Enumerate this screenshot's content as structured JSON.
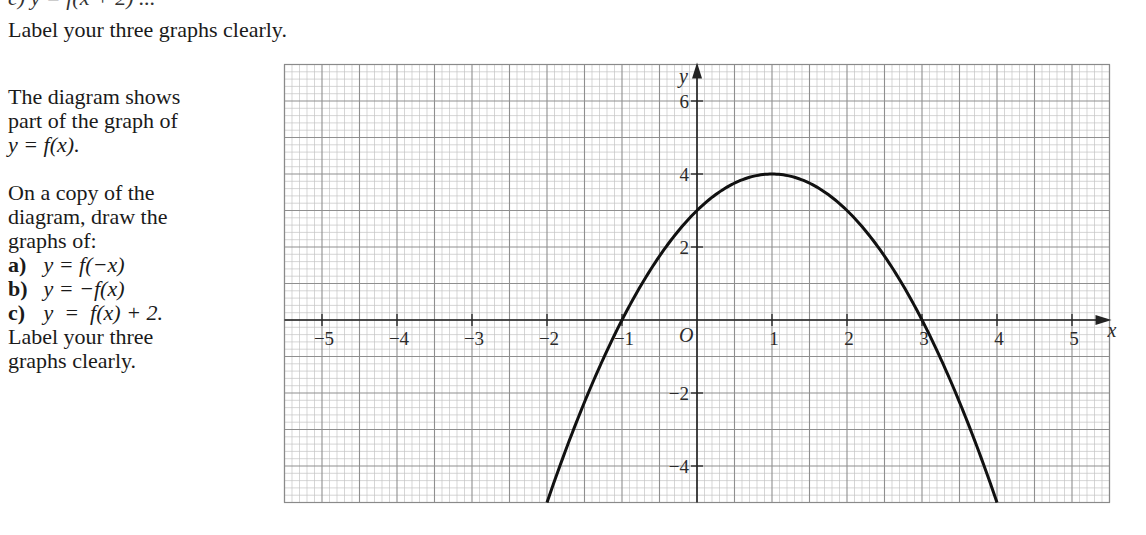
{
  "header": {
    "cut_off_line": "c) y = f(x + 2) ...",
    "instruction": "Label your three graphs clearly."
  },
  "question": {
    "intro_lines": [
      "The diagram shows",
      "part of the graph of",
      "y = f(x)."
    ],
    "task_lines": [
      "On a copy of the",
      "diagram, draw the",
      "graphs of:"
    ],
    "parts": [
      {
        "label": "a)",
        "expr": "y = f(−x)"
      },
      {
        "label": "b)",
        "expr": "y = −f(x)"
      },
      {
        "label": "c)",
        "expr": "y  =  f(x) + 2."
      }
    ],
    "closing_lines": [
      "Label your three",
      "graphs clearly."
    ]
  },
  "chart_data": {
    "type": "line",
    "title": "",
    "xlabel": "x",
    "ylabel": "y",
    "origin_label": "O",
    "xlim": [
      -5.5,
      5.5
    ],
    "ylim": [
      -5,
      7
    ],
    "grid": true,
    "grid_minor_per_major": 5,
    "x_ticks": [
      -5,
      -4,
      -3,
      -2,
      -1,
      1,
      2,
      3,
      4,
      5
    ],
    "x_tick_labels": [
      "−5",
      "−4",
      "−3",
      "−2",
      "−1",
      "1",
      "2",
      "3",
      "4",
      "5"
    ],
    "y_ticks": [
      6,
      4,
      2,
      -2,
      -4
    ],
    "y_tick_labels": [
      "6",
      "4",
      "2",
      "−2",
      "−4"
    ],
    "series": [
      {
        "name": "y = f(x)",
        "function": "-(x-1)^2 + 4",
        "x": [
          -2.0,
          -1.5,
          -1.0,
          -0.5,
          0.0,
          0.5,
          1.0,
          1.5,
          2.0,
          2.5,
          3.0,
          3.5,
          4.0
        ],
        "y": [
          -5.0,
          -2.25,
          0.0,
          1.75,
          3.0,
          3.75,
          4.0,
          3.75,
          3.0,
          1.75,
          0.0,
          -2.25,
          -5.0
        ]
      }
    ],
    "key_points": {
      "vertex": [
        1,
        4
      ],
      "y_intercept": [
        0,
        3
      ],
      "x_intercepts": [
        [
          -1,
          0
        ],
        [
          3,
          0
        ]
      ]
    }
  }
}
